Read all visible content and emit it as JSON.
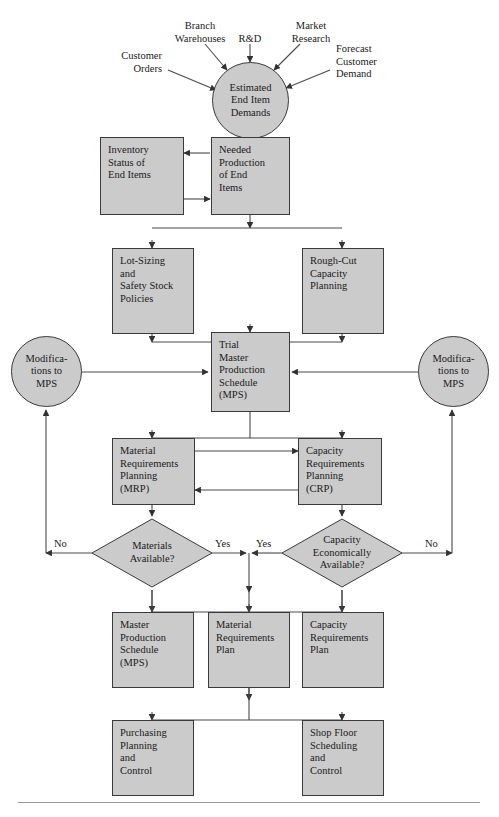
{
  "figure": {
    "type": "flowchart",
    "title": "",
    "style": {
      "node_fill": "#cbcbcb",
      "node_border": "#3a3a3a",
      "connector": "#4a4a4a",
      "text": "#1a1a1a",
      "rule": "#9a9a9a"
    }
  },
  "inputs": [
    {
      "id": "customer-orders",
      "lines": [
        "Customer",
        "Orders"
      ]
    },
    {
      "id": "branch-warehouses",
      "lines": [
        "Branch",
        "Warehouses"
      ]
    },
    {
      "id": "rd",
      "lines": [
        "R&D"
      ]
    },
    {
      "id": "market-research",
      "lines": [
        "Market",
        "Research"
      ]
    },
    {
      "id": "forecast-customer-demand",
      "lines": [
        "Forecast",
        "Customer",
        "Demand"
      ]
    }
  ],
  "nodes": {
    "estimated_end_item_demands": {
      "lines": [
        "Estimated",
        "End Item",
        "Demands"
      ],
      "shape": "circle"
    },
    "inventory_status": {
      "lines": [
        "Inventory",
        "Status of",
        "End Items"
      ],
      "shape": "rect"
    },
    "needed_production": {
      "lines": [
        "Needed",
        "Production",
        "of End",
        "Items"
      ],
      "shape": "rect"
    },
    "lot_sizing": {
      "lines": [
        "Lot-Sizing",
        "and",
        "Safety Stock",
        "Policies"
      ],
      "shape": "rect"
    },
    "rough_cut": {
      "lines": [
        "Rough-Cut",
        "Capacity",
        "Planning"
      ],
      "shape": "rect"
    },
    "mods_left": {
      "lines": [
        "Modifica-",
        "tions to",
        "MPS"
      ],
      "shape": "circle"
    },
    "trial_mps": {
      "lines": [
        "Trial",
        "Master",
        "Production",
        "Schedule",
        "(MPS)"
      ],
      "shape": "rect"
    },
    "mods_right": {
      "lines": [
        "Modifica-",
        "tions to",
        "MPS"
      ],
      "shape": "circle"
    },
    "mrp": {
      "lines": [
        "Material",
        "Requirements",
        "Planning",
        "(MRP)"
      ],
      "shape": "rect"
    },
    "crp": {
      "lines": [
        "Capacity",
        "Requirements",
        "Planning",
        "(CRP)"
      ],
      "shape": "rect"
    },
    "materials_available": {
      "lines": [
        "Materials",
        "Available?"
      ],
      "shape": "diamond"
    },
    "capacity_available": {
      "lines": [
        "Capacity",
        "Economically",
        "Available?"
      ],
      "shape": "diamond"
    },
    "master_production_schedule": {
      "lines": [
        "Master",
        "Production",
        "Schedule",
        "(MPS)"
      ],
      "shape": "rect"
    },
    "material_requirements_plan": {
      "lines": [
        "Material",
        "Requirements",
        "Plan"
      ],
      "shape": "rect"
    },
    "capacity_requirements_plan": {
      "lines": [
        "Capacity",
        "Requirements",
        "Plan"
      ],
      "shape": "rect"
    },
    "purchasing": {
      "lines": [
        "Purchasing",
        "Planning",
        "and",
        "Control"
      ],
      "shape": "rect"
    },
    "shop_floor": {
      "lines": [
        "Shop Floor",
        "Scheduling",
        "and",
        "Control"
      ],
      "shape": "rect"
    }
  },
  "edge_labels": {
    "no_left": "No",
    "yes_left": "Yes",
    "yes_right": "Yes",
    "no_right": "No"
  }
}
